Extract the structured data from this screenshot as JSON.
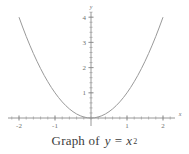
{
  "figure": {
    "caption_words": "Graph of",
    "caption_lhs": "y",
    "caption_eq": "=",
    "caption_base": "x",
    "caption_exp": "2"
  },
  "chart_data": {
    "type": "line",
    "xlabel": "x",
    "ylabel": "y",
    "xlim": [
      -2.2,
      2.2
    ],
    "ylim": [
      -0.35,
      4.35
    ],
    "grid": false,
    "legend": null,
    "axis_label_x": "x",
    "axis_label_y": "y",
    "xticks": [
      -2,
      -1,
      1,
      2
    ],
    "xticklabels": [
      "-2",
      "-1",
      "1",
      "2"
    ],
    "yticks": [
      1,
      2,
      3,
      4
    ],
    "yticklabels": [
      "1",
      "2",
      "3",
      "4"
    ],
    "x_minor_step": 0.2,
    "y_minor_step": 0.2,
    "series": [
      {
        "name": "y = x^2",
        "equation": "y = x^2",
        "color": "#9a9a9a",
        "x": [
          -2,
          -1.9,
          -1.8,
          -1.7,
          -1.6,
          -1.5,
          -1.4,
          -1.3,
          -1.2,
          -1.1,
          -1,
          -0.9,
          -0.8,
          -0.7,
          -0.6,
          -0.5,
          -0.4,
          -0.3,
          -0.2,
          -0.1,
          0,
          0.1,
          0.2,
          0.3,
          0.4,
          0.5,
          0.6,
          0.7,
          0.8,
          0.9,
          1,
          1.1,
          1.2,
          1.3,
          1.4,
          1.5,
          1.6,
          1.7,
          1.8,
          1.9,
          2
        ],
        "values": [
          4,
          3.61,
          3.24,
          2.89,
          2.56,
          2.25,
          1.96,
          1.69,
          1.44,
          1.21,
          1,
          0.81,
          0.64,
          0.49,
          0.36,
          0.25,
          0.16,
          0.09,
          0.04,
          0.01,
          0,
          0.01,
          0.04,
          0.09,
          0.16,
          0.25,
          0.36,
          0.49,
          0.64,
          0.81,
          1,
          1.21,
          1.44,
          1.69,
          1.96,
          2.25,
          2.56,
          2.89,
          3.24,
          3.61,
          4
        ]
      }
    ]
  },
  "colors": {
    "curve": "#9a9a9a",
    "axis": "#8c8c8c",
    "tick_text": "#6f6f6f",
    "caption_text": "#3d3d3d",
    "background": "#ffffff"
  }
}
